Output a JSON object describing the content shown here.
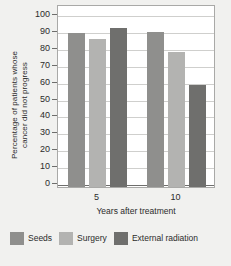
{
  "chart_data": {
    "type": "bar",
    "title": "",
    "subtitle": "",
    "xlabel": "Years after treatment",
    "ylabel": "Percentage of patients whose\ncancer did not progress",
    "categories": [
      "5",
      "10"
    ],
    "series": [
      {
        "name": "Seeds",
        "values": [
          89,
          89.5
        ],
        "color": "#8f8f8d"
      },
      {
        "name": "Surgery",
        "values": [
          85.5,
          77.5
        ],
        "color": "#b3b3b1"
      },
      {
        "name": "External radiation",
        "values": [
          91.5,
          58
        ],
        "color": "#6f6f6d"
      }
    ],
    "ylim": [
      0,
      100
    ],
    "ytick_values": [
      0,
      10,
      20,
      30,
      40,
      50,
      60,
      70,
      80,
      90,
      100
    ],
    "ytick_labels": [
      "0",
      "10",
      "20",
      "30",
      "40",
      "50",
      "60",
      "70",
      "80",
      "90",
      "100"
    ],
    "grid": true,
    "grid_axis": "y",
    "legend_position": "bottom",
    "background_color": "#f1f1ef",
    "plot_background_color": "#ffffff",
    "axis_color": "#6e6e6c",
    "grid_color": "#cfcfcd"
  }
}
